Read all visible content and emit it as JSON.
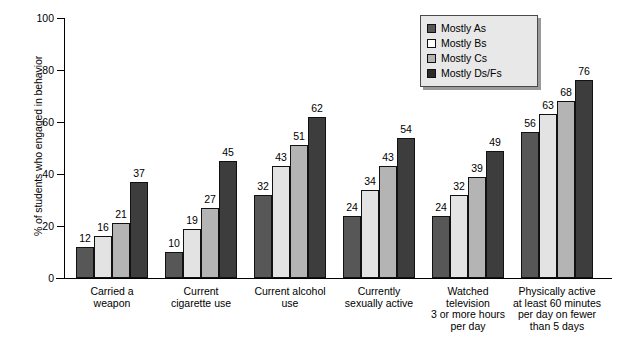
{
  "chart_data": {
    "type": "bar",
    "title": "",
    "xlabel": "",
    "ylabel": "% of students who engaged in behavior",
    "ylim": [
      0,
      100
    ],
    "ytick_labels": [
      "0",
      "20",
      "40",
      "60",
      "80",
      "100"
    ],
    "yticks": [
      0,
      20,
      40,
      60,
      80,
      100
    ],
    "grid": false,
    "legend_position": "top-right",
    "categories": [
      "Carried a\nweapon",
      "Current\ncigarette use",
      "Current alcohol\nuse",
      "Currently\nsexually active",
      "Watched\ntelevision\n3 or more hours\nper day",
      "Physically active\nat least 60 minutes\nper day on fewer\nthan 5 days"
    ],
    "series": [
      {
        "name": "Mostly As",
        "color": "#575757",
        "values": [
          12,
          10,
          32,
          24,
          24,
          56
        ]
      },
      {
        "name": "Mostly Bs",
        "color": "#e3e3e3",
        "values": [
          16,
          19,
          43,
          34,
          32,
          63
        ]
      },
      {
        "name": "Mostly Cs",
        "color": "#b4b4b4",
        "values": [
          21,
          27,
          51,
          43,
          39,
          68
        ]
      },
      {
        "name": "Mostly Ds/Fs",
        "color": "#3d3d3d",
        "values": [
          37,
          45,
          62,
          54,
          49,
          76
        ]
      }
    ]
  },
  "legend": {
    "items": [
      {
        "label": "Mostly As"
      },
      {
        "label": "Mostly Bs"
      },
      {
        "label": "Mostly Cs"
      },
      {
        "label": "Mostly Ds/Fs"
      }
    ]
  }
}
